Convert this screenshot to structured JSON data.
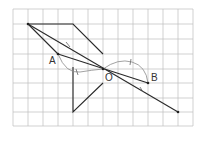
{
  "diagram": {
    "title": "",
    "grid": {
      "left": 13,
      "top": 9,
      "cell_w": 15,
      "cell_h": 14.6,
      "cols": 12,
      "rows": 8,
      "color": "#bdbdbd"
    },
    "points": {
      "P": {
        "x": 28,
        "y": 24,
        "label": ""
      },
      "A": {
        "x": 58,
        "y": 54,
        "label": "A"
      },
      "O": {
        "x": 103,
        "y": 69,
        "label": "O"
      },
      "B": {
        "x": 148,
        "y": 83,
        "label": "B"
      },
      "E": {
        "x": 178,
        "y": 112,
        "label": ""
      }
    },
    "labels": {
      "A": "A",
      "O": "O",
      "B": "B"
    },
    "line_color": "#2a2a2a",
    "arc_color": "#8a8a8a"
  }
}
